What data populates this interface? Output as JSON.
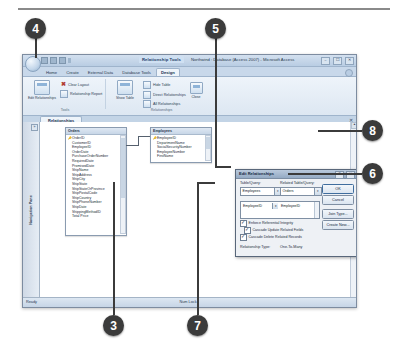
{
  "callouts": [
    {
      "id": "callout-4",
      "label": "4"
    },
    {
      "id": "callout-5",
      "label": "5"
    },
    {
      "id": "callout-8",
      "label": "8"
    },
    {
      "id": "callout-6",
      "label": "6"
    },
    {
      "id": "callout-3",
      "label": "3"
    },
    {
      "id": "callout-7",
      "label": "7"
    }
  ],
  "window": {
    "contextual_tab_label": "Relationship Tools",
    "title": "Northwind : Database (Access 2007) - Microsoft Access",
    "minimize": "–",
    "maximize": "☐",
    "close": "✕"
  },
  "ribbon": {
    "tabs": [
      {
        "label": "Home",
        "active": false
      },
      {
        "label": "Create",
        "active": false
      },
      {
        "label": "External Data",
        "active": false
      },
      {
        "label": "Database Tools",
        "active": false
      },
      {
        "label": "Design",
        "active": true
      }
    ],
    "groups": [
      {
        "name": "Tools",
        "big_button": "Edit\nRelationships",
        "small_buttons": [
          "Clear Layout",
          "Relationship Report"
        ]
      },
      {
        "name": "Relationships",
        "big_button": "Show\nTable",
        "small_buttons": [
          "Hide Table",
          "Direct Relationships",
          "All Relationships"
        ],
        "close_button": "Close"
      }
    ],
    "edit_relationships_label": "Edit\nRelationships",
    "show_table_label": "Show\nTable",
    "close_label": "Close",
    "clear_layout_label": "Clear Layout",
    "relationship_report_label": "Relationship Report",
    "hide_table_label": "Hide Table",
    "direct_relationships_label": "Direct Relationships",
    "all_relationships_label": "All Relationships",
    "group_tools_label": "Tools",
    "group_relationships_label": "Relationships"
  },
  "document_tab": {
    "label": "Relationships",
    "close": "✕"
  },
  "nav_pane": {
    "label": "Navigation Pane",
    "expand_icon": "»"
  },
  "tables": [
    {
      "name": "Orders",
      "fields": [
        "OrderID",
        "CustomerID",
        "EmployeeID",
        "OrderDate",
        "PurchaseOrderNumber",
        "RequiredDate",
        "PromisedDate",
        "ShipName",
        "ShipAddress",
        "ShipCity",
        "ShipState",
        "ShipStateOrProvince",
        "ShipPostalCode",
        "ShipCountry",
        "ShipPhoneNumber",
        "ShipDate",
        "ShippingMethodID",
        "Total Price"
      ],
      "key_field": "OrderID"
    },
    {
      "name": "Employees",
      "fields": [
        "EmployeeID",
        "DepartmentName",
        "SocialSecurityNumber",
        "EmployeeNumber",
        "FirstName"
      ],
      "key_field": "EmployeeID"
    }
  ],
  "dialog": {
    "title": "Edit Relationships",
    "help_button": "?",
    "close_button": "✕",
    "table_query_label": "Table/Query:",
    "related_table_query_label": "Related Table/Query:",
    "table_query_value": "Employees",
    "related_table_query_value": "Orders",
    "join_left_field": "EmployeeID",
    "join_right_field": "EmployeeID",
    "dropdown_arrow": "▾",
    "enforce_referential_integrity": {
      "label": "Enforce Referential Integrity",
      "checked": true
    },
    "cascade_update": {
      "label": "Cascade Update Related Fields",
      "checked": true
    },
    "cascade_delete": {
      "label": "Cascade Delete Related Records",
      "checked": true
    },
    "relationship_type_label": "Relationship Type:",
    "relationship_type_value": "One-To-Many",
    "buttons": {
      "ok": "OK",
      "cancel": "Cancel",
      "join_type": "Join Type...",
      "create_new": "Create New..."
    }
  },
  "status_bar": {
    "ready": "Ready",
    "num_lock": "Num Lock"
  },
  "colors": {
    "callout_bg": "#3b3b3b",
    "ribbon_accent": "#c8d8ea",
    "dialog_title": "#94aac4"
  }
}
